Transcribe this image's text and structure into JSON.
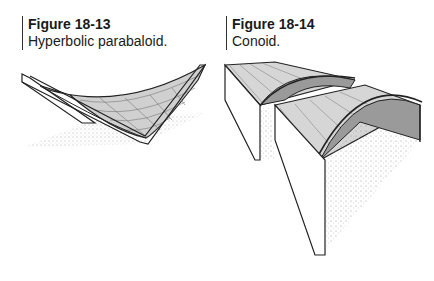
{
  "figures": [
    {
      "number": "Figure 18-13",
      "caption": "Hyperbolic parabaloid.",
      "illustration": "hyperbolic-paraboloid-shell-drawing"
    },
    {
      "number": "Figure 18-14",
      "caption": "Conoid.",
      "illustration": "conoid-shell-drawing"
    }
  ],
  "colors": {
    "shell_light": "#d4d4d4",
    "shell_dark": "#9a9a9a",
    "line": "#222222",
    "stipple": "#b0b0b0"
  }
}
